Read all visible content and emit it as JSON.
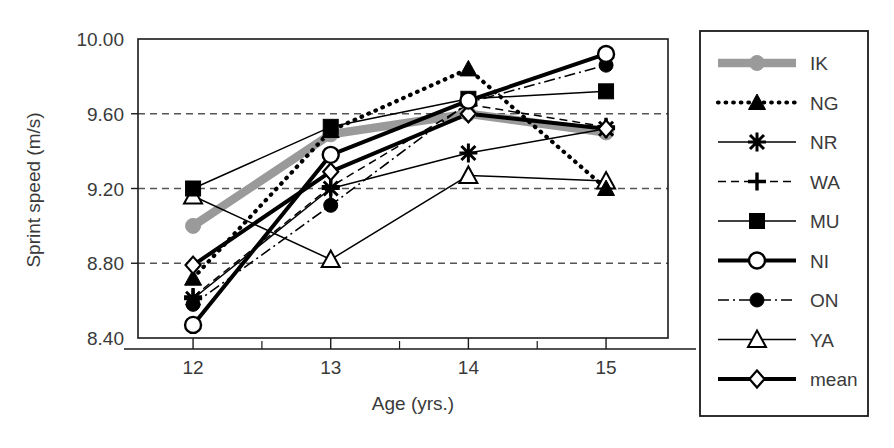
{
  "figure": {
    "background": "#ffffff",
    "axis_color": "#1a1a1a",
    "grid_color": "#555555",
    "text_color": "#3a3a3a",
    "ik_gray": "#9a9a9a"
  },
  "axes": {
    "ylabel": "Sprint speed  (m/s)",
    "xlabel": "Age  (yrs.)",
    "yticks": [
      "10.00",
      "9.60",
      "9.20",
      "8.80",
      "8.40"
    ],
    "xticks": [
      "12",
      "13",
      "14",
      "15"
    ]
  },
  "legend": {
    "items": [
      {
        "label": "IK",
        "style": "thick-gray",
        "marker": "circle-gray"
      },
      {
        "label": "NG",
        "style": "dotted",
        "marker": "triangle-filled"
      },
      {
        "label": "NR",
        "style": "thin-solid",
        "marker": "star"
      },
      {
        "label": "WA",
        "style": "dashed",
        "marker": "plus"
      },
      {
        "label": "MU",
        "style": "thin-solid",
        "marker": "square-filled"
      },
      {
        "label": "NI",
        "style": "thick-solid",
        "marker": "circle-open"
      },
      {
        "label": "ON",
        "style": "dash-dot",
        "marker": "circle-filled"
      },
      {
        "label": "YA",
        "style": "thin-solid",
        "marker": "triangle-open"
      },
      {
        "label": "mean",
        "style": "thick-solid",
        "marker": "diamond-open"
      }
    ]
  },
  "chart_data": {
    "type": "line",
    "title": "",
    "xlabel": "Age  (yrs.)",
    "ylabel": "Sprint speed  (m/s)",
    "x": [
      12,
      13,
      14,
      15
    ],
    "xlim": [
      11.6,
      15.45
    ],
    "ylim": [
      8.4,
      10.0
    ],
    "yticks": [
      8.4,
      8.8,
      9.2,
      9.6,
      10.0
    ],
    "grid": "horizontal-dashed",
    "legend_position": "right-outside",
    "series": [
      {
        "name": "IK",
        "style": "thick-gray",
        "marker": "circle-gray",
        "values": [
          9.0,
          9.49,
          9.6,
          9.5
        ]
      },
      {
        "name": "NG",
        "style": "dotted",
        "marker": "triangle-filled",
        "values": [
          8.72,
          9.51,
          9.84,
          9.2
        ]
      },
      {
        "name": "NR",
        "style": "thin-solid",
        "marker": "star",
        "values": [
          8.61,
          9.2,
          9.39,
          9.52
        ]
      },
      {
        "name": "WA",
        "style": "dashed",
        "marker": "plus",
        "values": [
          8.62,
          9.21,
          9.65,
          9.53
        ]
      },
      {
        "name": "MU",
        "style": "thin-solid",
        "marker": "square-filled",
        "values": [
          9.2,
          9.53,
          9.68,
          9.72
        ]
      },
      {
        "name": "NI",
        "style": "thick-solid",
        "marker": "circle-open",
        "values": [
          8.47,
          9.38,
          9.67,
          9.92
        ]
      },
      {
        "name": "ON",
        "style": "dash-dot",
        "marker": "circle-filled",
        "values": [
          8.58,
          9.11,
          9.66,
          9.86
        ]
      },
      {
        "name": "YA",
        "style": "thin-solid",
        "marker": "triangle-open",
        "values": [
          9.16,
          8.82,
          9.27,
          9.24
        ]
      },
      {
        "name": "mean",
        "style": "thick-solid",
        "marker": "diamond-open",
        "values": [
          8.79,
          9.29,
          9.6,
          9.52
        ]
      }
    ]
  }
}
